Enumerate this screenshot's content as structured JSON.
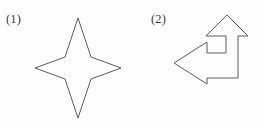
{
  "figure": {
    "background_color": "#fdfdfd",
    "stroke_color": "#4a4a4a",
    "fill_color": "#fdfdfd",
    "items": [
      {
        "label": "(1)",
        "shape_name": "four-pointed-star",
        "points": "78,18 91,57 121,68 91,79 78,118 65,79 35,68 65,57"
      },
      {
        "label": "(2)",
        "shape_name": "bent-arrow-up-left",
        "points": "227,15 248,36 238,36 238,78 207,78 207,84 174,63 207,42 207,53 226,53 226,36 206,36"
      }
    ]
  }
}
